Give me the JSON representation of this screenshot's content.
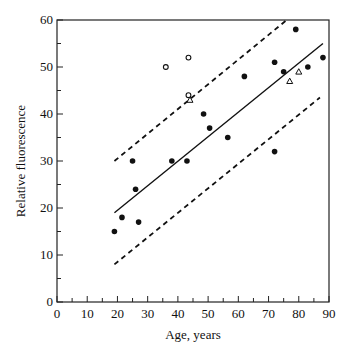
{
  "chart_data": {
    "type": "scatter",
    "title": "",
    "xlabel": "Age, years",
    "ylabel": "Relative fluorescence",
    "xlim": [
      0,
      90
    ],
    "ylim": [
      0,
      60
    ],
    "xticks": [
      0,
      10,
      20,
      30,
      40,
      50,
      60,
      70,
      80,
      90
    ],
    "yticks": [
      0,
      10,
      20,
      30,
      40,
      50,
      60
    ],
    "minor_tick_step": 5,
    "grid": false,
    "legend": null,
    "series": [
      {
        "name": "filled circles",
        "marker": "filled-circle",
        "points": [
          [
            19,
            15
          ],
          [
            21.5,
            18
          ],
          [
            25,
            30
          ],
          [
            26,
            24
          ],
          [
            27,
            17
          ],
          [
            38,
            30
          ],
          [
            43,
            30
          ],
          [
            48.5,
            40
          ],
          [
            50.5,
            37
          ],
          [
            56.5,
            35
          ],
          [
            62,
            48
          ],
          [
            72,
            32
          ],
          [
            72,
            51
          ],
          [
            75,
            49
          ],
          [
            79,
            58
          ],
          [
            83,
            50
          ],
          [
            88,
            52
          ]
        ]
      },
      {
        "name": "open circles",
        "marker": "open-circle",
        "points": [
          [
            36,
            50
          ],
          [
            43.5,
            52
          ],
          [
            43.5,
            44
          ]
        ]
      },
      {
        "name": "open triangles",
        "marker": "open-triangle",
        "points": [
          [
            44,
            43
          ],
          [
            77,
            47
          ],
          [
            80,
            49
          ]
        ]
      }
    ],
    "lines": [
      {
        "name": "regression",
        "style": "solid",
        "from": [
          19,
          19
        ],
        "to": [
          88,
          55
        ]
      },
      {
        "name": "upper bound",
        "style": "dashed",
        "from": [
          19,
          30
        ],
        "to": [
          76,
          60
        ]
      },
      {
        "name": "lower bound",
        "style": "dashed",
        "from": [
          19,
          8
        ],
        "to": [
          87,
          43.5
        ]
      }
    ]
  }
}
